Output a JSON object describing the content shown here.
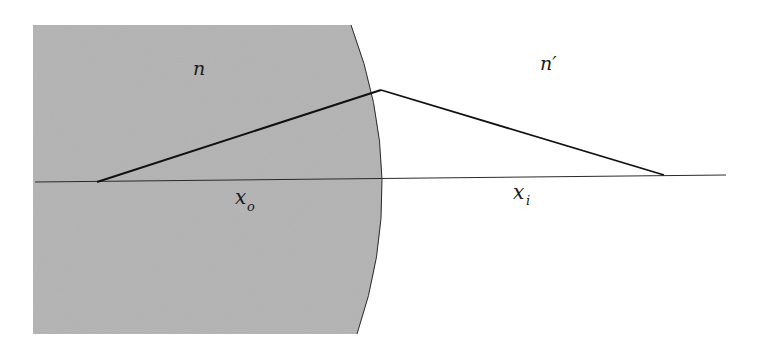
{
  "diagram": {
    "colors": {
      "medium": "#b3b3b3",
      "line": "#1a1a1a",
      "background": "#ffffff"
    },
    "labels": {
      "n_object": "n",
      "n_image": "n′",
      "x_object": "x",
      "x_object_sub": "o",
      "x_image": "x",
      "x_image_sub": "i"
    },
    "geometry": {
      "medium_region": {
        "left": 33,
        "top": 25,
        "bottom": 334,
        "arc_top_x": 351,
        "arc_vertex_x": 395,
        "arc_bottom_x": 357
      },
      "optical_axis": {
        "x1": 35,
        "y1": 182,
        "x2": 726,
        "y2": 175
      },
      "object_point": {
        "x": 97,
        "y": 182
      },
      "refraction_point": {
        "x": 381,
        "y": 90
      },
      "image_point": {
        "x": 664,
        "y": 175
      }
    }
  }
}
